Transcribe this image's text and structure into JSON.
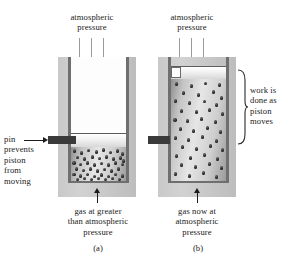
{
  "figure": {
    "panels": [
      {
        "id": "a",
        "caption": "(a)",
        "top_label": "atmospheric\npressure",
        "side_label": "pin\nprevents\npiston\nfrom\nmoving",
        "bottom_label": "gas at greater\nthan atmospheric\npressure",
        "piston_state": "held-down-by-pin",
        "gas_particle_count": 46,
        "gas_density": "high"
      },
      {
        "id": "b",
        "caption": "(b)",
        "top_label": "atmospheric\npressure",
        "side_label": "work is\ndone as\npiston\nmoves",
        "bottom_label": "gas now at\natmospheric\npressure",
        "piston_state": "raised-pin-removed",
        "gas_particle_count": 44,
        "gas_density": "low"
      }
    ],
    "colors": {
      "apparatus_gray": "#c9c9c9",
      "cylinder_wall": "#6f6f6f",
      "pin_dark": "#3a3a3a",
      "arrow_gray": "#9a9a9a",
      "arrow_black": "#1c1c1c",
      "particle": "#1a1a1a",
      "background": "#ffffff"
    },
    "arrows": {
      "atmospheric_count": 3,
      "gas_pointer_direction": "up",
      "pin_pointer_direction": "right"
    }
  }
}
